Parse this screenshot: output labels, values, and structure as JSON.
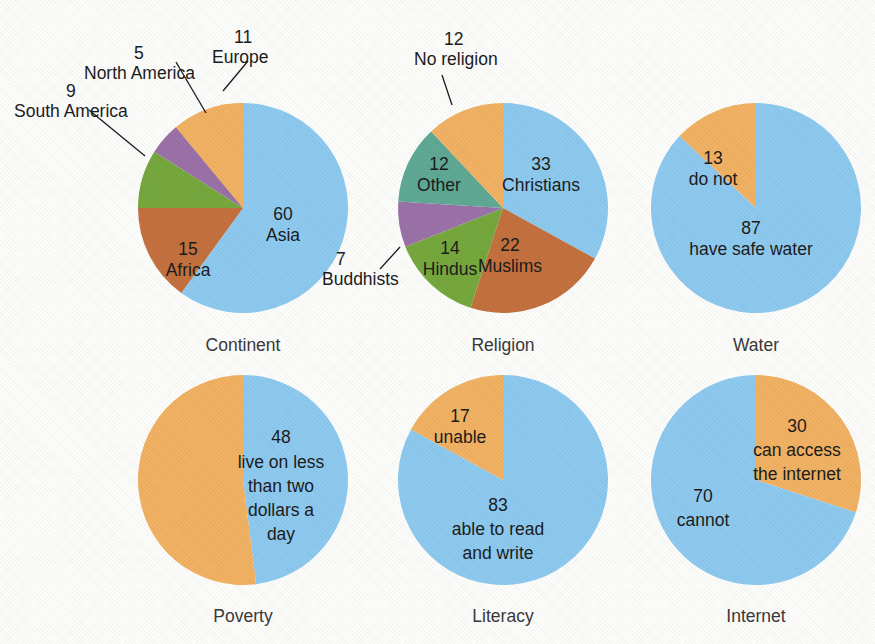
{
  "palette": {
    "blue": "#8ecaf0",
    "orange": "#f2b263",
    "terracotta": "#c4713f",
    "green": "#77a83e",
    "purple": "#9b72a8",
    "teal": "#5fa995",
    "background": "#fdfdfc",
    "text": "#1c1c1c",
    "caption": "#3a3a3a"
  },
  "chart_data": [
    {
      "type": "pie",
      "title": "Continent",
      "id": "continent",
      "start_angle": 0,
      "direction": "clockwise",
      "slices": [
        {
          "label": "Asia",
          "value": 60,
          "color": "#8ecaf0",
          "label_placement": "inside",
          "num": "60",
          "name": "Asia"
        },
        {
          "label": "Africa",
          "value": 15,
          "color": "#c4713f",
          "label_placement": "inside",
          "num": "15",
          "name": "Africa"
        },
        {
          "label": "South America",
          "value": 9,
          "color": "#77a83e",
          "label_placement": "outside",
          "num": "9",
          "name": "South America"
        },
        {
          "label": "North America",
          "value": 5,
          "color": "#9b72a8",
          "label_placement": "outside",
          "num": "5",
          "name": "North America"
        },
        {
          "label": "Europe",
          "value": 11,
          "color": "#f2b263",
          "label_placement": "outside",
          "num": "11",
          "name": "Europe"
        }
      ]
    },
    {
      "type": "pie",
      "title": "Religion",
      "id": "religion",
      "start_angle": 0,
      "direction": "clockwise",
      "slices": [
        {
          "label": "Christians",
          "value": 33,
          "color": "#8ecaf0",
          "label_placement": "inside",
          "num": "33",
          "name": "Christians"
        },
        {
          "label": "Muslims",
          "value": 22,
          "color": "#c4713f",
          "label_placement": "inside",
          "num": "22",
          "name": "Muslims"
        },
        {
          "label": "Hindus",
          "value": 14,
          "color": "#77a83e",
          "label_placement": "inside",
          "num": "14",
          "name": "Hindus"
        },
        {
          "label": "Buddhists",
          "value": 7,
          "color": "#9b72a8",
          "label_placement": "outside",
          "num": "7",
          "name": "Buddhists"
        },
        {
          "label": "Other",
          "value": 12,
          "color": "#5fa995",
          "label_placement": "inside",
          "num": "12",
          "name": "Other"
        },
        {
          "label": "No religion",
          "value": 12,
          "color": "#f2b263",
          "label_placement": "outside",
          "num": "12",
          "name": "No religion"
        }
      ]
    },
    {
      "type": "pie",
      "title": "Water",
      "id": "water",
      "start_angle": 0,
      "direction": "clockwise",
      "slices": [
        {
          "label": "have safe water",
          "value": 87,
          "color": "#8ecaf0",
          "label_placement": "inside",
          "num": "87",
          "name": "have safe water"
        },
        {
          "label": "do not",
          "value": 13,
          "color": "#f2b263",
          "label_placement": "inside",
          "num": "13",
          "name": "do not"
        }
      ]
    },
    {
      "type": "pie",
      "title": "Poverty",
      "id": "poverty",
      "start_angle": 0,
      "direction": "clockwise",
      "slices": [
        {
          "label": "live on less than two dollars a day",
          "value": 48,
          "color": "#8ecaf0",
          "label_placement": "inside",
          "num": "48",
          "name": "live on less than two dollars a day"
        },
        {
          "label": "",
          "value": 52,
          "color": "#f2b263",
          "label_placement": "none",
          "num": "",
          "name": "remainder"
        }
      ]
    },
    {
      "type": "pie",
      "title": "Literacy",
      "id": "literacy",
      "start_angle": 0,
      "direction": "clockwise",
      "slices": [
        {
          "label": "able to read and write",
          "value": 83,
          "color": "#8ecaf0",
          "label_placement": "inside",
          "num": "83",
          "name": "able to read and write"
        },
        {
          "label": "unable",
          "value": 17,
          "color": "#f2b263",
          "label_placement": "inside",
          "num": "17",
          "name": "unable"
        }
      ]
    },
    {
      "type": "pie",
      "title": "Internet",
      "id": "internet",
      "start_angle": 0,
      "direction": "clockwise",
      "slices": [
        {
          "label": "can access the internet",
          "value": 30,
          "color": "#f2b263",
          "label_placement": "inside",
          "num": "30",
          "name": "can access the internet"
        },
        {
          "label": "cannot",
          "value": 70,
          "color": "#8ecaf0",
          "label_placement": "inside",
          "num": "70",
          "name": "cannot"
        }
      ]
    }
  ],
  "captions": {
    "continent": "Continent",
    "religion": "Religion",
    "water": "Water",
    "poverty": "Poverty",
    "literacy": "Literacy",
    "internet": "Internet"
  },
  "continent": {
    "asia_num": "60",
    "asia_label": "Asia",
    "africa_num": "15",
    "africa_label": "Africa",
    "south_america_num": "9",
    "south_america_label": "South America",
    "north_america_num": "5",
    "north_america_label": "North America",
    "europe_num": "11",
    "europe_label": "Europe"
  },
  "religion": {
    "christians_num": "33",
    "christians_label": "Christians",
    "muslims_num": "22",
    "muslims_label": "Muslims",
    "hindus_num": "14",
    "hindus_label": "Hindus",
    "buddhists_num": "7",
    "buddhists_label": "Buddhists",
    "other_num": "12",
    "other_label": "Other",
    "no_religion_num": "12",
    "no_religion_label": "No religion"
  },
  "water": {
    "have_num": "87",
    "have_label": "have safe water",
    "donot_num": "13",
    "donot_label": "do not"
  },
  "poverty": {
    "num": "48",
    "line1": "live on less",
    "line2": "than two",
    "line3": "dollars a",
    "line4": "day"
  },
  "literacy": {
    "able_num": "83",
    "able_line1": "able to read",
    "able_line2": "and write",
    "unable_num": "17",
    "unable_label": "unable"
  },
  "internet": {
    "access_num": "30",
    "access_line1": "can access",
    "access_line2": "the internet",
    "cannot_num": "70",
    "cannot_label": "cannot"
  }
}
